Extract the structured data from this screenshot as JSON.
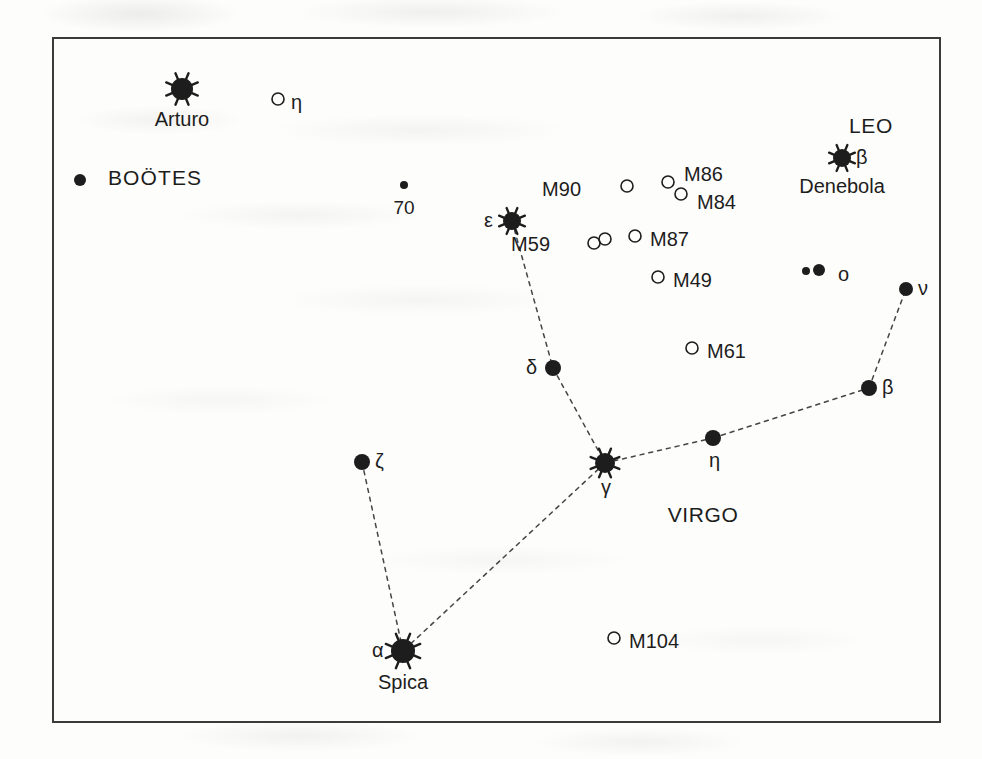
{
  "figure": {
    "kind": "star-chart",
    "region_title": "Virgo / Coma region star chart",
    "frame": {
      "x": 52,
      "y": 37,
      "width": 889,
      "height": 686,
      "border_color": "#3b3b3b"
    },
    "ink_color": "#1d1d1d",
    "background_color": "#fdfdfc"
  },
  "constellation_labels": [
    {
      "name": "label-bootes",
      "text": "BOÖTES",
      "x": 108,
      "y": 170,
      "bullet": {
        "x": 80,
        "y": 180,
        "r": 6
      }
    },
    {
      "name": "label-leo",
      "text": "LEO",
      "x": 871,
      "y": 118
    },
    {
      "name": "label-virgo",
      "text": "VIRGO",
      "x": 703,
      "y": 507
    }
  ],
  "stars": [
    {
      "name": "star-arturo",
      "label": "Arturo",
      "greek": "",
      "x": 182,
      "y": 89,
      "r": 11,
      "type": "bright",
      "label_pos": "below",
      "greek_pos": ""
    },
    {
      "name": "star-denebola",
      "label": "Denebola",
      "greek": "β",
      "x": 842,
      "y": 158,
      "r": 9,
      "type": "bright",
      "label_pos": "below",
      "greek_pos": "right"
    },
    {
      "name": "star-spica",
      "label": "Spica",
      "greek": "α",
      "x": 403,
      "y": 651,
      "r": 12,
      "type": "bright",
      "label_pos": "below",
      "greek_pos": "left"
    },
    {
      "name": "star-epsilon",
      "label": "",
      "greek": "ε",
      "x": 512,
      "y": 221,
      "r": 9,
      "type": "bright",
      "label_pos": "",
      "greek_pos": "left"
    },
    {
      "name": "star-gamma",
      "label": "",
      "greek": "γ",
      "x": 605,
      "y": 463,
      "r": 10,
      "type": "bright",
      "label_pos": "",
      "greek_pos": "below"
    },
    {
      "name": "star-delta",
      "label": "",
      "greek": "δ",
      "x": 553,
      "y": 368,
      "r": 8,
      "type": "plain",
      "label_pos": "",
      "greek_pos": "left"
    },
    {
      "name": "star-zeta",
      "label": "",
      "greek": "ζ",
      "x": 362,
      "y": 462,
      "r": 8,
      "type": "plain",
      "label_pos": "",
      "greek_pos": "right"
    },
    {
      "name": "star-eta-virgo",
      "label": "",
      "greek": "η",
      "x": 713,
      "y": 438,
      "r": 8,
      "type": "plain",
      "label_pos": "",
      "greek_pos": "below"
    },
    {
      "name": "star-beta-virgo",
      "label": "",
      "greek": "β",
      "x": 869,
      "y": 388,
      "r": 8,
      "type": "plain",
      "label_pos": "",
      "greek_pos": "right"
    },
    {
      "name": "star-nu",
      "label": "",
      "greek": "ν",
      "x": 906,
      "y": 289,
      "r": 7,
      "type": "plain",
      "label_pos": "",
      "greek_pos": "right"
    },
    {
      "name": "star-70",
      "label": "70",
      "greek": "",
      "x": 404,
      "y": 185,
      "r": 4,
      "type": "faint",
      "label_pos": "below",
      "greek_pos": ""
    }
  ],
  "double_stars": [
    {
      "name": "star-omicron",
      "greek": "ο",
      "components": [
        {
          "x": 806,
          "y": 271,
          "r": 4
        },
        {
          "x": 819,
          "y": 270,
          "r": 6
        }
      ],
      "greek_x": 838,
      "greek_y": 278
    }
  ],
  "deep_sky_objects": [
    {
      "name": "dso-eta-coma",
      "label": "η",
      "x": 278,
      "y": 99,
      "r": 6,
      "label_side": "right",
      "label_x": 291,
      "label_y": 106
    },
    {
      "name": "dso-m90",
      "label": "M90",
      "x": 627,
      "y": 186,
      "r": 6,
      "label_side": "left",
      "label_x": 581,
      "label_y": 193
    },
    {
      "name": "dso-m86",
      "label": "M86",
      "x": 668,
      "y": 182,
      "r": 6,
      "label_side": "right",
      "label_x": 684,
      "label_y": 178
    },
    {
      "name": "dso-m84",
      "label": "M84",
      "x": 681,
      "y": 194,
      "r": 6,
      "label_side": "right",
      "label_x": 697,
      "label_y": 206
    },
    {
      "name": "dso-m87",
      "label": "M87",
      "x": 635,
      "y": 236,
      "r": 6,
      "label_side": "right",
      "label_x": 650,
      "label_y": 243
    },
    {
      "name": "dso-m49",
      "label": "M49",
      "x": 658,
      "y": 277,
      "r": 6,
      "label_side": "right",
      "label_x": 673,
      "label_y": 284
    },
    {
      "name": "dso-m61",
      "label": "M61",
      "x": 692,
      "y": 348,
      "r": 6,
      "label_side": "right",
      "label_x": 707,
      "label_y": 355
    },
    {
      "name": "dso-m104",
      "label": "M104",
      "x": 614,
      "y": 638,
      "r": 6,
      "label_side": "right",
      "label_x": 629,
      "label_y": 645
    }
  ],
  "double_dso": [
    {
      "name": "dso-m59",
      "label": "M59",
      "label_x": 550,
      "label_y": 248,
      "components": [
        {
          "x": 594,
          "y": 243,
          "r": 6
        },
        {
          "x": 605,
          "y": 239,
          "r": 6
        }
      ]
    }
  ],
  "constellation_lines": [
    {
      "name": "line-epsilon-delta",
      "from": [
        512,
        221
      ],
      "to": [
        553,
        368
      ]
    },
    {
      "name": "line-delta-gamma",
      "from": [
        553,
        368
      ],
      "to": [
        605,
        463
      ]
    },
    {
      "name": "line-gamma-eta",
      "from": [
        605,
        463
      ],
      "to": [
        713,
        438
      ]
    },
    {
      "name": "line-eta-beta",
      "from": [
        713,
        438
      ],
      "to": [
        869,
        388
      ]
    },
    {
      "name": "line-beta-nu",
      "from": [
        869,
        388
      ],
      "to": [
        906,
        289
      ]
    },
    {
      "name": "line-gamma-spica",
      "from": [
        605,
        463
      ],
      "to": [
        403,
        651
      ]
    },
    {
      "name": "line-zeta-spica",
      "from": [
        362,
        462
      ],
      "to": [
        403,
        651
      ]
    }
  ]
}
